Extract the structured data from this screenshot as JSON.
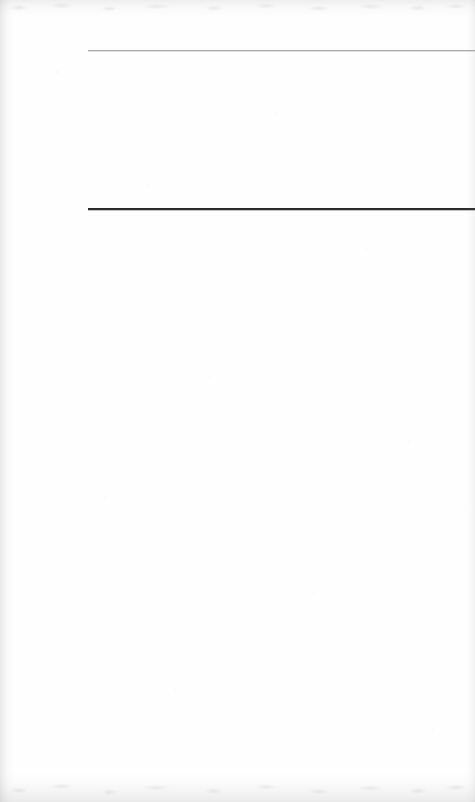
{
  "document": {
    "kind": "scanned-page",
    "page_label": "",
    "body_text": "",
    "background_color": "#fefefe",
    "width": 475,
    "height": 802
  },
  "rules": [
    {
      "name": "upper-rule",
      "style": "light",
      "color": "#a9a9a9",
      "thickness_px": 1,
      "left_px": 88,
      "top_px": 50,
      "right_px": 0
    },
    {
      "name": "lower-rule",
      "style": "dark",
      "color": "#2b2b2b",
      "thickness_px": 2,
      "left_px": 88,
      "top_px": 208,
      "right_px": 0
    }
  ],
  "regions": {
    "header_band": {
      "label": "",
      "top_px": 0,
      "height_px": 50
    },
    "between_rules_band": {
      "label": "",
      "top_px": 51,
      "height_px": 157
    },
    "body_region": {
      "label": "",
      "top_px": 210,
      "height_px": 592
    }
  },
  "scan_artifacts": {
    "left_edge_shadow": "#787878",
    "right_edge_shadow": "#8c8c8c",
    "top_edge_shadow": "#828282",
    "bottom_edge_shadow": "#7d7d7d",
    "paper_grain": "#969696"
  }
}
